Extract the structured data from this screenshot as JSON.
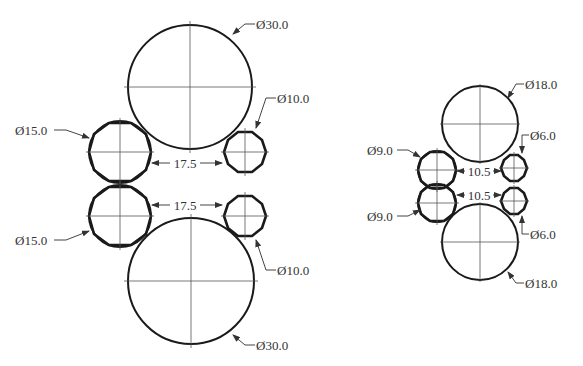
{
  "diagram": {
    "type": "technical-drawing",
    "units": "diameter",
    "left_assembly": {
      "top_large_circle": {
        "label": "Ø30.0",
        "cx": 190,
        "cy": 87,
        "r": 62
      },
      "bottom_large_circle": {
        "label": "Ø30.0",
        "cx": 191,
        "cy": 281,
        "r": 63
      },
      "upper_left_circle": {
        "label": "Ø15.0",
        "cx": 120,
        "cy": 152,
        "r": 31
      },
      "lower_left_circle": {
        "label": "Ø15.0",
        "cx": 120,
        "cy": 216,
        "r": 31
      },
      "upper_right_circle": {
        "label": "Ø10.0",
        "cx": 245,
        "cy": 152,
        "r": 21
      },
      "lower_right_circle": {
        "label": "Ø10.0",
        "cx": 245,
        "cy": 216,
        "r": 21
      },
      "upper_spacing": "17.5",
      "lower_spacing": "17.5"
    },
    "right_assembly": {
      "top_large_circle": {
        "label": "Ø18.0",
        "cx": 480,
        "cy": 124,
        "r": 38
      },
      "bottom_large_circle": {
        "label": "Ø18.0",
        "cx": 480,
        "cy": 242,
        "r": 38
      },
      "upper_left_circle": {
        "label": "Ø9.0",
        "cx": 437,
        "cy": 170,
        "r": 19
      },
      "lower_left_circle": {
        "label": "Ø9.0",
        "cx": 437,
        "cy": 203,
        "r": 19
      },
      "upper_right_circle": {
        "label": "Ø6.0",
        "cx": 514,
        "cy": 168,
        "r": 13
      },
      "lower_right_circle": {
        "label": "Ø6.0",
        "cx": 514,
        "cy": 201,
        "r": 13
      },
      "upper_spacing": "10.5",
      "lower_spacing": "10.5"
    }
  }
}
